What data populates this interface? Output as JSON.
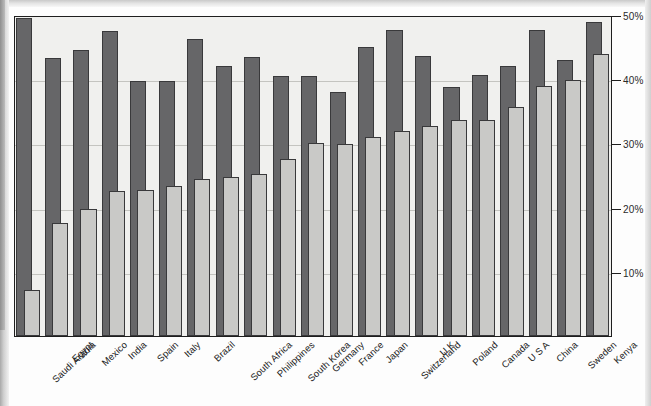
{
  "chart_data": {
    "type": "bar",
    "title": "",
    "subtitle": "",
    "xlabel": "",
    "ylabel": "",
    "ylim": [
      0,
      50
    ],
    "yticks": [
      10,
      20,
      30,
      40,
      50
    ],
    "ytick_labels": [
      "10%",
      "20%",
      "30%",
      "40%",
      "50%"
    ],
    "grid": true,
    "legend": "none",
    "orientation": "vertical",
    "overlap_style": "overlapping-pairs",
    "categories": [
      "Saudi Arabia",
      "Egypt",
      "Mexico",
      "India",
      "Spain",
      "Italy",
      "Brazil",
      "South Africa",
      "Philippines",
      "South Korea",
      "Germany",
      "France",
      "Japan",
      "Switzerland",
      "U K",
      "Poland",
      "Canada",
      "U S A",
      "China",
      "Sweden",
      "Kenya"
    ],
    "series": [
      {
        "name": "series-back",
        "color": "#666668",
        "values": [
          49.5,
          43.3,
          44.5,
          47.5,
          39.7,
          39.7,
          46.2,
          42.0,
          43.5,
          40.5,
          40.5,
          38.0,
          45.0,
          47.7,
          43.6,
          38.8,
          40.6,
          42.0,
          47.6,
          43.0,
          48.9
        ]
      },
      {
        "name": "series-front",
        "color": "#c9c9c7",
        "values": [
          7.2,
          17.6,
          19.8,
          22.6,
          22.7,
          23.3,
          24.4,
          24.7,
          25.2,
          27.6,
          30.0,
          29.9,
          31.0,
          32.0,
          32.7,
          33.6,
          33.6,
          35.6,
          39.0,
          39.8,
          44.0
        ]
      }
    ]
  },
  "axis": {
    "y_unit": "%"
  }
}
